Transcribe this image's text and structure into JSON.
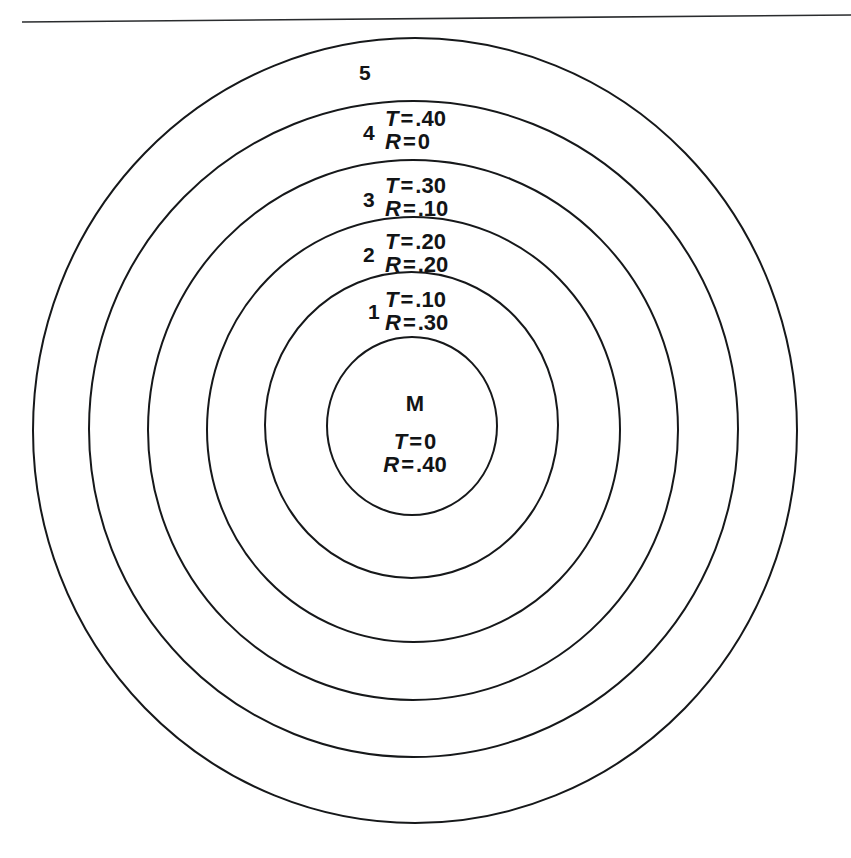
{
  "figure": {
    "background_color": "#ffffff",
    "stroke_color": "#16181a",
    "page_rule": {
      "present": true,
      "left_y": 22,
      "right_y": 15
    }
  },
  "rings": [
    {
      "id": "ring-5",
      "number_label": "5",
      "number_pos": {
        "x": 359,
        "y": 62
      },
      "circle": {
        "cx": 415,
        "cy": 430.5,
        "rx": 382,
        "ry": 392.5
      },
      "stroke_width": 2.0,
      "T": null,
      "R": null,
      "value_pos": null
    },
    {
      "id": "ring-4",
      "number_label": "4",
      "number_pos": {
        "x": 363,
        "y": 122
      },
      "circle": {
        "cx": 413.5,
        "cy": 429,
        "rx": 324.5,
        "ry": 328
      },
      "stroke_width": 2.0,
      "T": {
        "var": "T",
        "eq": "=",
        "val": ".40"
      },
      "R": {
        "var": "R",
        "eq": "=",
        "val": "0"
      },
      "value_pos": {
        "x": 385,
        "y": 107
      }
    },
    {
      "id": "ring-3",
      "number_label": "3",
      "number_pos": {
        "x": 363,
        "y": 189
      },
      "circle": {
        "cx": 413,
        "cy": 430,
        "rx": 265,
        "ry": 270
      },
      "stroke_width": 2.0,
      "T": {
        "var": "T",
        "eq": "=",
        "val": ".30"
      },
      "R": {
        "var": "R",
        "eq": "=",
        "val": ".10"
      },
      "value_pos": {
        "x": 385,
        "y": 174
      }
    },
    {
      "id": "ring-2",
      "number_label": "2",
      "number_pos": {
        "x": 363,
        "y": 244
      },
      "circle": {
        "cx": 413.5,
        "cy": 429.5,
        "rx": 206.5,
        "ry": 212.5
      },
      "stroke_width": 2.0,
      "T": {
        "var": "T",
        "eq": "=",
        "val": ".20"
      },
      "R": {
        "var": "R",
        "eq": "=",
        "val": ".20"
      },
      "value_pos": {
        "x": 385,
        "y": 230
      }
    },
    {
      "id": "ring-1",
      "number_label": "1",
      "number_pos": {
        "x": 368,
        "y": 301
      },
      "circle": {
        "cx": 411.5,
        "cy": 425,
        "rx": 146.5,
        "ry": 153
      },
      "stroke_width": 2.0,
      "T": {
        "var": "T",
        "eq": "=",
        "val": ".10"
      },
      "R": {
        "var": "R",
        "eq": "=",
        "val": ".30"
      },
      "value_pos": {
        "x": 385,
        "y": 288
      }
    }
  ],
  "center": {
    "id": "ring-M",
    "letter": "M",
    "letter_pos": {
      "x": 415,
      "y": 392
    },
    "circle": {
      "cx": 412,
      "cy": 426,
      "rx": 85,
      "ry": 89
    },
    "stroke_width": 2.0,
    "T": {
      "var": "T",
      "eq": "=",
      "val": "0"
    },
    "R": {
      "var": "R",
      "eq": "=",
      "val": ".40"
    },
    "value_pos": {
      "x": 415,
      "y": 430
    }
  },
  "chart_data": {
    "type": "diagram",
    "categories": [
      "M",
      "1",
      "2",
      "3",
      "4",
      "5"
    ],
    "series": [
      {
        "name": "T",
        "values": [
          0,
          0.1,
          0.2,
          0.3,
          0.4,
          null
        ]
      },
      {
        "name": "R",
        "values": [
          0.4,
          0.3,
          0.2,
          0.1,
          0,
          null
        ]
      }
    ]
  }
}
